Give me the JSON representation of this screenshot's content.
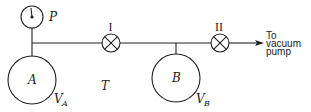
{
  "diagram": {
    "type": "gas-expansion-apparatus",
    "gauge": {
      "label": "P"
    },
    "vessels": [
      {
        "id": "A",
        "label": "A",
        "volume_label": "V",
        "volume_sub": "A"
      },
      {
        "id": "B",
        "label": "B",
        "volume_label": "V",
        "volume_sub": "B"
      }
    ],
    "valves": [
      {
        "id": "I",
        "label": "I"
      },
      {
        "id": "II",
        "label": "II"
      }
    ],
    "tube": {
      "label": "T"
    },
    "outlet": {
      "lines": [
        "To",
        "vacuum",
        "pump"
      ]
    },
    "colors": {
      "stroke": "#222222",
      "background": "#ffffff"
    }
  }
}
